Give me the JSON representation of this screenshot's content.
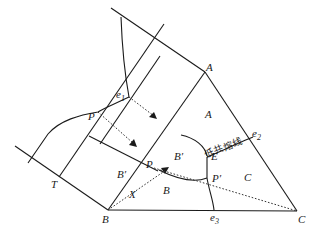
{
  "diagram": {
    "vertices": {
      "A": {
        "label": "A"
      },
      "B": {
        "label": "B"
      },
      "C": {
        "label": "C"
      }
    },
    "regions": {
      "A": "A",
      "B_prime_upper": "B′",
      "B_prime_left": "B′",
      "B": "B",
      "C": "C"
    },
    "points": {
      "e1": {
        "main": "e",
        "sub": "1"
      },
      "e2": {
        "main": "e",
        "sub": "2"
      },
      "e3": {
        "main": "e",
        "sub": "3"
      },
      "E": "E",
      "P_left": "P",
      "P_inner": "P",
      "P_prime": "P′",
      "T": "T",
      "X": "X"
    },
    "annotations": {
      "eutectic_line": "低共熔线"
    },
    "colors": {
      "line": "#1a1a1a",
      "background": "#ffffff"
    }
  }
}
